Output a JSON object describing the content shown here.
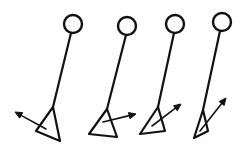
{
  "diagram": {
    "title": "Leg push-off sequence with ground reaction force vectors",
    "background_color": "#ffffff",
    "ink_color": "#111111",
    "width": 243,
    "height": 155,
    "style": "hand-drawn line art",
    "frame_count": 4
  },
  "chart_data": {
    "type": "diagram",
    "title": "Leg push-off sequence with ground reaction force vectors",
    "frames": [
      {
        "index": 1,
        "label": "frame-1",
        "head": {
          "cx": 73,
          "cy": 24,
          "r": 9,
          "stroke_width": 2.4
        },
        "leg": {
          "x1": 71,
          "y1": 33,
          "x2": 53,
          "y2": 107,
          "stroke_width": 2.2
        },
        "foot": {
          "points": "53,107 36,131 60,141 53,107",
          "stroke_width": 2.2,
          "heel_x": 36,
          "heel_y": 131,
          "toe_x": 60,
          "toe_y": 141,
          "ankle_x": 53,
          "ankle_y": 107
        },
        "vector": {
          "x1": 46,
          "y1": 129,
          "x2": 15,
          "y2": 112,
          "angle_deg": 151,
          "direction": "up-and-backward",
          "stroke_width": 1.6,
          "head_size": 7
        }
      },
      {
        "index": 2,
        "label": "frame-2",
        "head": {
          "cx": 127,
          "cy": 26,
          "r": 9,
          "stroke_width": 2.4
        },
        "leg": {
          "x1": 126,
          "y1": 35,
          "x2": 107,
          "y2": 109,
          "stroke_width": 2.2
        },
        "foot": {
          "points": "107,109 89,134 117,137 107,109",
          "stroke_width": 2.2,
          "heel_x": 89,
          "heel_y": 134,
          "toe_x": 117,
          "toe_y": 137,
          "ankle_x": 107,
          "ankle_y": 109
        },
        "vector": {
          "x1": 103,
          "y1": 122,
          "x2": 136,
          "y2": 114,
          "angle_deg": 14,
          "direction": "forward-slightly-up",
          "stroke_width": 1.6,
          "head_size": 7
        }
      },
      {
        "index": 3,
        "label": "frame-3",
        "head": {
          "cx": 175,
          "cy": 24,
          "r": 9,
          "stroke_width": 2.4
        },
        "leg": {
          "x1": 174,
          "y1": 33,
          "x2": 158,
          "y2": 107,
          "stroke_width": 2.2
        },
        "foot": {
          "points": "158,107 140,134 165,131 158,107",
          "stroke_width": 2.2,
          "heel_x": 140,
          "heel_y": 134,
          "toe_x": 165,
          "toe_y": 131,
          "ankle_x": 158,
          "ankle_y": 107
        },
        "vector": {
          "x1": 152,
          "y1": 126,
          "x2": 181,
          "y2": 104,
          "angle_deg": 37,
          "direction": "forward-and-up",
          "stroke_width": 1.6,
          "head_size": 7
        }
      },
      {
        "index": 4,
        "label": "frame-4",
        "head": {
          "cx": 222,
          "cy": 22,
          "r": 9,
          "stroke_width": 2.4
        },
        "leg": {
          "x1": 220,
          "y1": 31,
          "x2": 203,
          "y2": 110,
          "stroke_width": 2.2
        },
        "foot": {
          "points": "203,110 194,138 208,131 203,110",
          "stroke_width": 2.2,
          "heel_x": 194,
          "heel_y": 138,
          "toe_x": 208,
          "toe_y": 131,
          "ankle_x": 203,
          "ankle_y": 110
        },
        "vector": {
          "x1": 200,
          "y1": 131,
          "x2": 226,
          "y2": 98,
          "angle_deg": 52,
          "direction": "steeply-forward-and-up",
          "stroke_width": 1.6,
          "head_size": 7
        }
      }
    ]
  }
}
